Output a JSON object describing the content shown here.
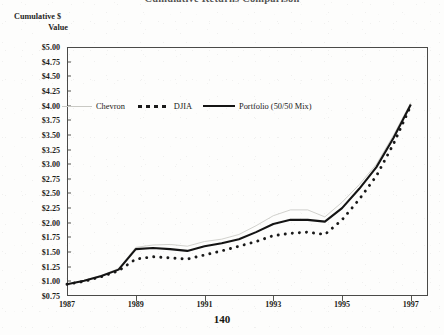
{
  "title": "Cumulative Returns Comparison",
  "page_number": "140",
  "y_axis_caption": {
    "line1": "Cumulative $",
    "line2": "Value"
  },
  "legend": {
    "position": "inside-top-left",
    "items": [
      {
        "label": "Chevron",
        "icon": "thin-line-swatch",
        "color": "#c9c9c4",
        "style": "solid-thin"
      },
      {
        "label": "DJIA",
        "icon": "dotted-line-swatch",
        "color": "#1a1a1a",
        "style": "dotted-bold"
      },
      {
        "label": "Portfolio (50/50 Mix)",
        "icon": "thick-line-swatch",
        "color": "#141414",
        "style": "solid-thick"
      }
    ]
  },
  "axes": {
    "y_ticks": [
      "$5.00",
      "$4.75",
      "$4.50",
      "$4.25",
      "$4.00",
      "$3.75",
      "$3.50",
      "$3.25",
      "$3.00",
      "$2.75",
      "$2.50",
      "$2.25",
      "$2.00",
      "$1.75",
      "$1.50",
      "$1.25",
      "$1.00",
      "$0.75"
    ],
    "x_ticks": [
      "1987",
      "1989",
      "1991",
      "1993",
      "1995",
      "1997"
    ]
  },
  "chart_data": {
    "type": "line",
    "title": "Cumulative Returns Comparison",
    "xlabel": "",
    "ylabel": "Cumulative $ Value",
    "ylim": [
      0.75,
      5.0
    ],
    "ytick_step": 0.25,
    "xlim": [
      1987,
      1997.5
    ],
    "grid": false,
    "legend_position": "inside-top-left",
    "x": [
      1987,
      1987.5,
      1988,
      1988.5,
      1989,
      1989.5,
      1990,
      1990.5,
      1991,
      1991.5,
      1992,
      1992.5,
      1993,
      1993.5,
      1994,
      1994.5,
      1995,
      1995.5,
      1996,
      1996.5,
      1997
    ],
    "xtick_labels": [
      "1987",
      "1989",
      "1991",
      "1993",
      "1995",
      "1997"
    ],
    "xtick_values": [
      1987,
      1989,
      1991,
      1993,
      1995,
      1997
    ],
    "series": [
      {
        "name": "Chevron",
        "style": "solid-thin",
        "color": "#c9c9c4",
        "values": [
          0.95,
          1.02,
          1.1,
          1.22,
          1.58,
          1.62,
          1.63,
          1.6,
          1.68,
          1.72,
          1.8,
          1.95,
          2.12,
          2.22,
          2.22,
          2.1,
          2.35,
          2.65,
          3.0,
          3.5,
          4.05
        ]
      },
      {
        "name": "DJIA",
        "style": "dotted-bold",
        "color": "#1a1a1a",
        "values": [
          0.95,
          1.0,
          1.08,
          1.18,
          1.38,
          1.42,
          1.4,
          1.38,
          1.45,
          1.52,
          1.6,
          1.68,
          1.78,
          1.82,
          1.84,
          1.8,
          2.05,
          2.4,
          2.8,
          3.35,
          4.0
        ]
      },
      {
        "name": "Portfolio (50/50 Mix)",
        "style": "solid-thick",
        "color": "#141414",
        "values": [
          0.95,
          1.01,
          1.09,
          1.2,
          1.55,
          1.57,
          1.55,
          1.52,
          1.6,
          1.65,
          1.72,
          1.84,
          1.98,
          2.05,
          2.05,
          2.02,
          2.25,
          2.58,
          2.95,
          3.45,
          4.02
        ]
      }
    ]
  }
}
